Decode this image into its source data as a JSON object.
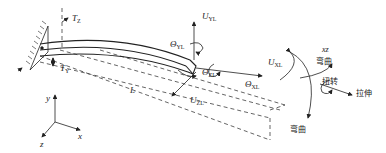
{
  "diagram": {
    "type": "cantilever-beam-loading",
    "labels": {
      "tz": {
        "sym": "T",
        "sub": "Z"
      },
      "ty": {
        "sym": "T",
        "sub": "Y"
      },
      "length": "L",
      "uyl": {
        "sym": "U",
        "sub": "YL"
      },
      "theta_yl": {
        "sym": "Θ",
        "sub": "YL"
      },
      "theta_zl": {
        "sym": "Θ",
        "sub": "ZL"
      },
      "theta_xl": {
        "sym": "Θ",
        "sub": "XL"
      },
      "uxl": {
        "sym": "U",
        "sub": "XL"
      },
      "uzl": {
        "sym": "U",
        "sub": "ZL"
      },
      "xz": "xz"
    },
    "modes": {
      "bending_top": "弯曲",
      "torsion": "扭转",
      "tension": "拉伸",
      "bending_bottom": "弯曲"
    },
    "axes": {
      "x": "x",
      "y": "y",
      "z": "z"
    },
    "colors": {
      "stroke": "#222222",
      "background": "#ffffff"
    }
  }
}
